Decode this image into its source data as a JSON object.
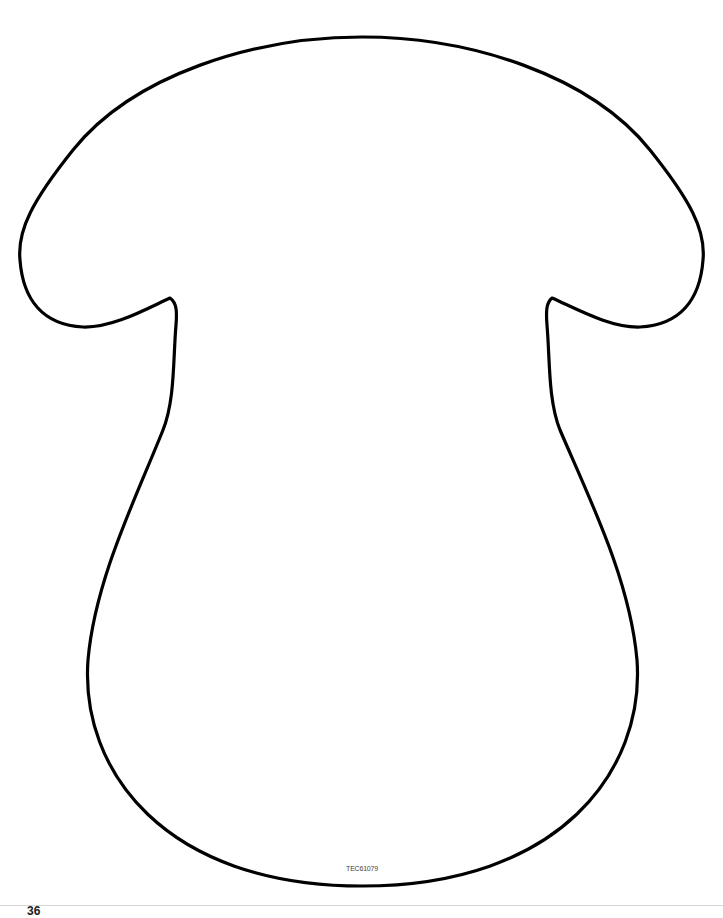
{
  "template": {
    "shape": "mushroom-outline",
    "stroke_color": "#000000",
    "background_color": "#ffffff",
    "code": "TEC61079"
  },
  "footer": {
    "page_number_fragment": "36"
  }
}
